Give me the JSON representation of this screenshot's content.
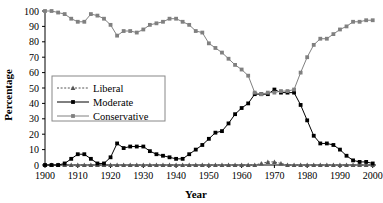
{
  "chart_data": {
    "type": "line",
    "title": "",
    "xlabel": "Year",
    "ylabel": "Percentage",
    "xlim": [
      1900,
      2001
    ],
    "ylim": [
      0,
      100
    ],
    "xticks": [
      1900,
      1910,
      1920,
      1930,
      1940,
      1950,
      1960,
      1970,
      1980,
      1990,
      2000
    ],
    "xtick_labels": [
      "1900",
      "1910",
      "1920",
      "1930",
      "1940",
      "1950",
      "1960",
      "1970",
      "1980",
      "1990",
      "2000"
    ],
    "yticks": [
      0,
      10,
      20,
      30,
      40,
      50,
      60,
      70,
      80,
      90,
      100
    ],
    "ytick_labels": [
      "0",
      "10",
      "20",
      "30",
      "40",
      "50",
      "60",
      "70",
      "80",
      "90",
      "100"
    ],
    "grid": false,
    "legend_position": "center-left",
    "x": [
      1900,
      1902,
      1904,
      1906,
      1908,
      1910,
      1912,
      1914,
      1916,
      1918,
      1920,
      1922,
      1924,
      1926,
      1928,
      1930,
      1932,
      1934,
      1936,
      1938,
      1940,
      1942,
      1944,
      1946,
      1948,
      1950,
      1952,
      1954,
      1956,
      1958,
      1960,
      1962,
      1964,
      1966,
      1968,
      1970,
      1972,
      1974,
      1976,
      1978,
      1980,
      1982,
      1984,
      1986,
      1988,
      1990,
      1992,
      1994,
      1996,
      1998,
      2000
    ],
    "series": [
      {
        "name": "Liberal",
        "color": "#555555",
        "line_style": "dotted",
        "marker": "triangle",
        "values": [
          0,
          0,
          0,
          0,
          0,
          0,
          0,
          0,
          0,
          0,
          0,
          0,
          0,
          0,
          0,
          0,
          0,
          0,
          0,
          0,
          0,
          0,
          0,
          0,
          0,
          0,
          0,
          0,
          0,
          0,
          0,
          0,
          0,
          1,
          2,
          2,
          1,
          0,
          0,
          0,
          0,
          0,
          0,
          0,
          0,
          0,
          0,
          0,
          0,
          0,
          0
        ]
      },
      {
        "name": "Moderate",
        "color": "#000000",
        "line_style": "solid",
        "marker": "square",
        "values": [
          0,
          0,
          0,
          1,
          4,
          7,
          7,
          4,
          1,
          1,
          5,
          14,
          11,
          12,
          12,
          12,
          9,
          7,
          6,
          5,
          4,
          4,
          7,
          10,
          13,
          17,
          21,
          22,
          27,
          33,
          37,
          40,
          46,
          46,
          46,
          49,
          47,
          47,
          47,
          39,
          29,
          19,
          14,
          14,
          13,
          10,
          6,
          3,
          2,
          2,
          1
        ]
      },
      {
        "name": "Conservative",
        "color": "#808080",
        "line_style": "solid",
        "marker": "square",
        "values": [
          100,
          100,
          99,
          98,
          95,
          93,
          93,
          98,
          97,
          95,
          91,
          84,
          87,
          87,
          86,
          88,
          91,
          92,
          93,
          95,
          95,
          93,
          91,
          87,
          86,
          79,
          76,
          73,
          69,
          65,
          62,
          58,
          47,
          46,
          47,
          47,
          48,
          48,
          49,
          60,
          70,
          78,
          82,
          82,
          85,
          88,
          90,
          93,
          93,
          94,
          94
        ]
      }
    ]
  },
  "legend": {
    "items": [
      {
        "label": "Liberal"
      },
      {
        "label": "Moderate"
      },
      {
        "label": "Conservative"
      }
    ]
  },
  "axes": {
    "x_title": "Year",
    "y_title": "Percentage"
  }
}
